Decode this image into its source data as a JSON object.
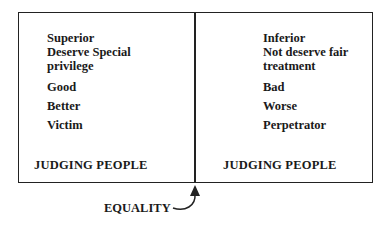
{
  "left_panel": {
    "items": [
      "Superior",
      "Deserve Special",
      "privilege",
      "Good",
      "Better",
      "Victim"
    ],
    "footer": "JUDGING PEOPLE"
  },
  "right_panel": {
    "items": [
      "Inferior",
      "Not deserve fair",
      "treatment",
      "Bad",
      "Worse",
      "Perpetrator"
    ],
    "footer": "JUDGING PEOPLE"
  },
  "pointer": {
    "label": "EQUALITY"
  }
}
